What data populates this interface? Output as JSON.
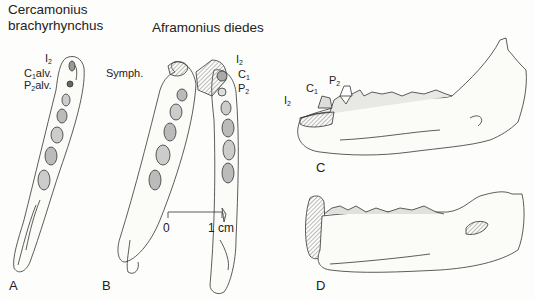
{
  "figure": {
    "species_a": {
      "line1": "Cercamonius",
      "line2": "brachyrhynchus"
    },
    "species_b": "Aframonius diedes",
    "panel_a_labels": {
      "i2": {
        "base": "I",
        "sub": "2"
      },
      "c1alv": {
        "base": "C",
        "sub": "1",
        "suffix": "alv."
      },
      "p2alv": {
        "base": "P",
        "sub": "2",
        "suffix": "alv."
      },
      "symph": "Symph."
    },
    "panel_b_labels": {
      "i2": {
        "base": "I",
        "sub": "2"
      },
      "c1": {
        "base": "C",
        "sub": "1"
      },
      "p2": {
        "base": "P",
        "sub": "2"
      }
    },
    "panel_c_labels": {
      "i2": {
        "base": "I",
        "sub": "2"
      },
      "c1": {
        "base": "C",
        "sub": "1"
      },
      "p2": {
        "base": "P",
        "sub": "2"
      }
    },
    "scale_bar": {
      "start": "0",
      "end": "1 cm"
    },
    "panels": [
      "A",
      "B",
      "C",
      "D"
    ]
  }
}
